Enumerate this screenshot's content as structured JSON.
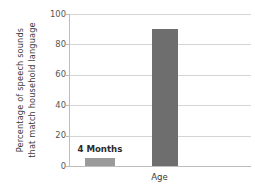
{
  "chart_data": {
    "type": "bar",
    "title": "",
    "xlabel": "Age",
    "ylabel_line1": "Percentage of speech sounds",
    "ylabel_line2": "that match household language",
    "categories": [
      "4 Months",
      ""
    ],
    "values": [
      5,
      90
    ],
    "ylim": [
      0,
      100
    ],
    "yticks": [
      0,
      20,
      40,
      60,
      80,
      100
    ],
    "ytick_labels": [
      "0",
      "20",
      "40",
      "60",
      "80",
      "100"
    ],
    "grid": true,
    "legend": "none",
    "annotations": [
      {
        "text": "4 Months",
        "series_index": 0
      }
    ],
    "bar_colors": [
      "#9a9a9a",
      "#6e6e6e"
    ],
    "axis_color": "#bdbdbd",
    "grid_color": "#d5d5d5",
    "background": "#ffffff"
  }
}
